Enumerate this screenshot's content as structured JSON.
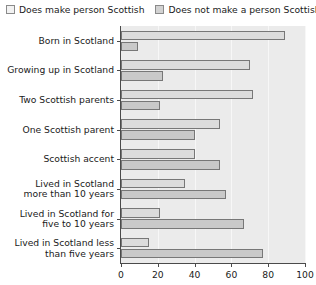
{
  "legend": {
    "position": "top",
    "entries": [
      {
        "label": "Does make person Scottish",
        "swatch": "legend-swatch-light",
        "color": "#f2f2f2"
      },
      {
        "label": "Does not make a person Scottish",
        "swatch": "legend-swatch-dark",
        "color": "#d2d2d2"
      }
    ]
  },
  "chart_data": {
    "type": "bar",
    "orientation": "horizontal",
    "title": "",
    "subtitle": "",
    "xlabel": "",
    "ylabel": "",
    "xlim": [
      0,
      100
    ],
    "xticks": [
      0,
      20,
      40,
      60,
      80,
      100
    ],
    "grid": true,
    "grid_axis": "x",
    "legend_position": "top",
    "categories": [
      "Born in Scotland",
      "Growing up in Scotland",
      "Two Scottish parents",
      "One Scottish parent",
      "Scottish accent",
      "Lived in Scotland\nmore than 10 years",
      "Lived in Scotland for\nfive to 10 years",
      "Lived in Scotland less\nthan five years"
    ],
    "series": [
      {
        "name": "Does make person Scottish",
        "color": "#dcdcdc",
        "values": [
          89,
          70,
          72,
          54,
          40,
          35,
          21,
          15
        ]
      },
      {
        "name": "Does not make a person Scottish",
        "color": "#c9c9c9",
        "values": [
          9,
          23,
          21,
          40,
          54,
          57,
          67,
          77
        ]
      }
    ]
  }
}
